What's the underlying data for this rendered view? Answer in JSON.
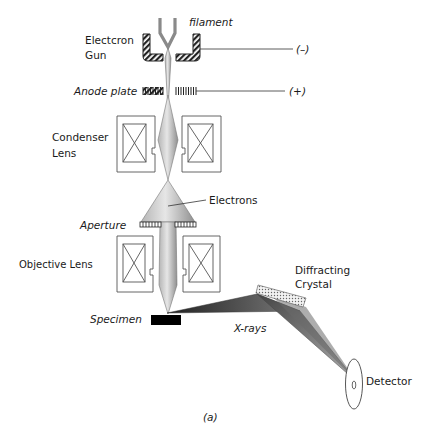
{
  "diagram": {
    "caption": "(a)",
    "labels": {
      "filament": "filament",
      "electron_gun_line1": "Electcron",
      "electron_gun_line2": "Gun",
      "negative_terminal": "(–)",
      "anode_plate": "Anode plate",
      "positive_terminal": "(+)",
      "condenser_line1": "Condenser",
      "condenser_line2": "Lens",
      "electrons": "Electrons",
      "aperture": "Aperture",
      "objective_lens": "Objective Lens",
      "diffracting_line1": "Diffracting",
      "diffracting_line2": "Crystal",
      "specimen": "Specimen",
      "xrays": "X-rays",
      "detector": "Detector"
    },
    "colors": {
      "beam_light": "#e0e0e0",
      "beam_dark": "#9a9a9a",
      "xray_dark": "#3a3a3a",
      "xray_mid": "#8a8a8a",
      "specimen": "#000000",
      "outline": "#555555"
    }
  }
}
